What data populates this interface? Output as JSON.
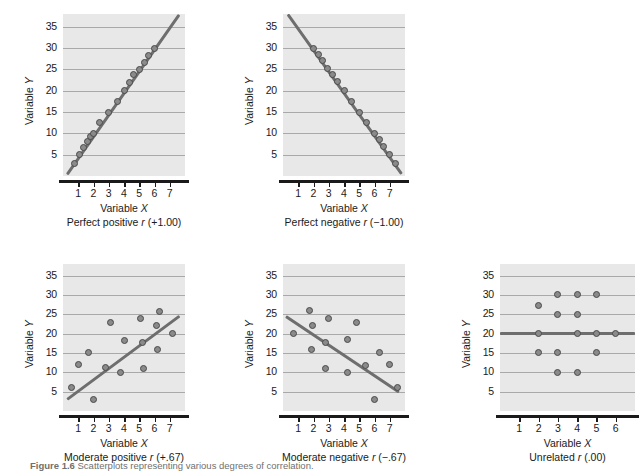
{
  "figure": {
    "caption_prefix": "Figure 1.6",
    "caption_text": "Scatterplots representing various degrees of correlation."
  },
  "axis_titles": {
    "y": "Variable Y",
    "x": "Variable X"
  },
  "chart_data": [
    {
      "id": "perfect-positive",
      "type": "scatter",
      "title": "Perfect positive r (+1.00)",
      "caption_plain": "Perfect positive",
      "caption_stat": "r",
      "caption_value": "(+1.00)",
      "xlabel": "Variable X",
      "ylabel": "Variable Y",
      "xlim": [
        0,
        8
      ],
      "ylim": [
        0,
        38
      ],
      "xticks": [
        1,
        2,
        3,
        4,
        5,
        6,
        7
      ],
      "yticks": [
        5,
        10,
        15,
        20,
        25,
        30,
        35
      ],
      "grid": true,
      "legend": "none",
      "points": [
        {
          "x": 0.75,
          "y": 3.0
        },
        {
          "x": 1.05,
          "y": 5.0
        },
        {
          "x": 1.35,
          "y": 6.8
        },
        {
          "x": 1.6,
          "y": 8.2
        },
        {
          "x": 1.8,
          "y": 9.3
        },
        {
          "x": 2.0,
          "y": 10.0
        },
        {
          "x": 2.4,
          "y": 12.5
        },
        {
          "x": 3.0,
          "y": 15.0
        },
        {
          "x": 3.6,
          "y": 17.5
        },
        {
          "x": 4.0,
          "y": 20.0
        },
        {
          "x": 4.35,
          "y": 22.0
        },
        {
          "x": 4.65,
          "y": 23.7
        },
        {
          "x": 5.0,
          "y": 25.0
        },
        {
          "x": 5.35,
          "y": 26.7
        },
        {
          "x": 5.6,
          "y": 28.3
        },
        {
          "x": 6.0,
          "y": 30.0
        }
      ],
      "trend": {
        "x1": 0.25,
        "y1": 0.5,
        "x2": 7.6,
        "y2": 38.0
      }
    },
    {
      "id": "perfect-negative",
      "type": "scatter",
      "title": "Perfect negative r (-1.00)",
      "caption_plain": "Perfect negative",
      "caption_stat": "r",
      "caption_value": "(−1.00)",
      "xlabel": "Variable X",
      "ylabel": "Variable Y",
      "xlim": [
        0,
        8
      ],
      "ylim": [
        0,
        38
      ],
      "xticks": [
        1,
        2,
        3,
        4,
        5,
        6,
        7
      ],
      "yticks": [
        5,
        10,
        15,
        20,
        25,
        30,
        35
      ],
      "grid": true,
      "legend": "none",
      "points": [
        {
          "x": 2.0,
          "y": 30.0
        },
        {
          "x": 2.3,
          "y": 28.4
        },
        {
          "x": 2.6,
          "y": 27.0
        },
        {
          "x": 2.95,
          "y": 25.2
        },
        {
          "x": 3.25,
          "y": 23.8
        },
        {
          "x": 3.55,
          "y": 22.2
        },
        {
          "x": 4.0,
          "y": 20.0
        },
        {
          "x": 4.5,
          "y": 17.5
        },
        {
          "x": 5.0,
          "y": 15.0
        },
        {
          "x": 5.5,
          "y": 12.5
        },
        {
          "x": 6.0,
          "y": 10.0
        },
        {
          "x": 6.3,
          "y": 8.6
        },
        {
          "x": 6.6,
          "y": 7.0
        },
        {
          "x": 7.0,
          "y": 5.0
        },
        {
          "x": 7.4,
          "y": 3.0
        }
      ],
      "trend": {
        "x1": 0.3,
        "y1": 38.0,
        "x2": 7.75,
        "y2": 0.6
      }
    },
    {
      "id": "moderate-positive",
      "type": "scatter",
      "title": "Moderate positive r (+.67)",
      "caption_plain": "Moderate positive",
      "caption_stat": "r",
      "caption_value": "(+.67)",
      "xlabel": "Variable X",
      "ylabel": "Variable Y",
      "xlim": [
        0,
        8
      ],
      "ylim": [
        0,
        38
      ],
      "xticks": [
        1,
        2,
        3,
        4,
        5,
        6,
        7
      ],
      "yticks": [
        5,
        10,
        15,
        20,
        25,
        30,
        35
      ],
      "grid": true,
      "legend": "none",
      "points": [
        {
          "x": 0.55,
          "y": 6.0
        },
        {
          "x": 1.0,
          "y": 12.0
        },
        {
          "x": 1.7,
          "y": 15.0
        },
        {
          "x": 2.0,
          "y": 3.0
        },
        {
          "x": 2.8,
          "y": 11.2
        },
        {
          "x": 3.1,
          "y": 22.8
        },
        {
          "x": 3.75,
          "y": 10.0
        },
        {
          "x": 4.0,
          "y": 18.2
        },
        {
          "x": 5.1,
          "y": 23.8
        },
        {
          "x": 5.2,
          "y": 17.8
        },
        {
          "x": 5.25,
          "y": 11.0
        },
        {
          "x": 6.2,
          "y": 16.0
        },
        {
          "x": 6.15,
          "y": 22.2
        },
        {
          "x": 6.3,
          "y": 25.8
        },
        {
          "x": 7.2,
          "y": 20.0
        }
      ],
      "trend": {
        "x1": 0.25,
        "y1": 3.0,
        "x2": 7.6,
        "y2": 24.5
      }
    },
    {
      "id": "moderate-negative",
      "type": "scatter",
      "title": "Moderate negative r (-.67)",
      "caption_plain": "Moderate negative",
      "caption_stat": "r",
      "caption_value": "(−.67)",
      "xlabel": "Variable X",
      "ylabel": "Variable Y",
      "xlim": [
        0,
        8
      ],
      "ylim": [
        0,
        38
      ],
      "xticks": [
        1,
        2,
        3,
        4,
        5,
        6,
        7
      ],
      "yticks": [
        5,
        10,
        15,
        20,
        25,
        30,
        35
      ],
      "grid": true,
      "legend": "none",
      "points": [
        {
          "x": 0.7,
          "y": 20.0
        },
        {
          "x": 1.75,
          "y": 26.0
        },
        {
          "x": 1.95,
          "y": 22.2
        },
        {
          "x": 1.85,
          "y": 16.0
        },
        {
          "x": 2.8,
          "y": 17.8
        },
        {
          "x": 3.0,
          "y": 24.0
        },
        {
          "x": 2.8,
          "y": 11.0
        },
        {
          "x": 4.2,
          "y": 18.4
        },
        {
          "x": 4.2,
          "y": 10.0
        },
        {
          "x": 4.85,
          "y": 23.0
        },
        {
          "x": 5.4,
          "y": 11.8
        },
        {
          "x": 6.0,
          "y": 3.0
        },
        {
          "x": 6.3,
          "y": 15.0
        },
        {
          "x": 7.0,
          "y": 12.0
        },
        {
          "x": 7.5,
          "y": 6.0
        }
      ],
      "trend": {
        "x1": 0.2,
        "y1": 24.5,
        "x2": 7.6,
        "y2": 5.0
      }
    },
    {
      "id": "unrelated",
      "type": "scatter",
      "title": "Unrelated r (.00)",
      "caption_plain": "Unrelated",
      "caption_stat": "r",
      "caption_value": "(.00)",
      "xlabel": "Variable X",
      "ylabel": "Variable Y",
      "xlim": [
        0,
        7
      ],
      "ylim": [
        0,
        38
      ],
      "xticks": [
        1,
        2,
        3,
        4,
        5,
        6
      ],
      "yticks": [
        5,
        10,
        15,
        20,
        25,
        30,
        35
      ],
      "grid": true,
      "legend": "none",
      "points": [
        {
          "x": 2.0,
          "y": 27.2
        },
        {
          "x": 3.0,
          "y": 30.0
        },
        {
          "x": 4.0,
          "y": 30.0
        },
        {
          "x": 5.0,
          "y": 30.0
        },
        {
          "x": 3.0,
          "y": 25.0
        },
        {
          "x": 4.0,
          "y": 25.0
        },
        {
          "x": 2.0,
          "y": 20.0
        },
        {
          "x": 4.0,
          "y": 20.0
        },
        {
          "x": 5.0,
          "y": 20.0
        },
        {
          "x": 6.0,
          "y": 20.0
        },
        {
          "x": 2.0,
          "y": 15.0
        },
        {
          "x": 3.0,
          "y": 15.0
        },
        {
          "x": 5.0,
          "y": 15.0
        },
        {
          "x": 3.0,
          "y": 10.0
        },
        {
          "x": 4.0,
          "y": 10.0
        }
      ],
      "trend": {
        "x1": 0.0,
        "y1": 20.0,
        "x2": 7.0,
        "y2": 20.0
      }
    }
  ]
}
